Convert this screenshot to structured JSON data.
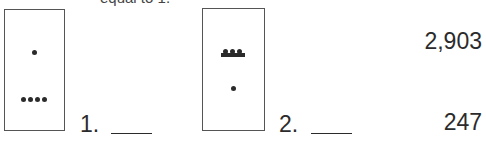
{
  "caption": "equal to 1.",
  "problems": [
    {
      "number": "1.",
      "glyph": {
        "top_level": {
          "dots": 1,
          "bars": 0
        },
        "bottom_level": {
          "dots": 4,
          "bars": 0
        }
      },
      "answer": ""
    },
    {
      "number": "2.",
      "glyph": {
        "top_level": {
          "dots": 3,
          "bars": 1
        },
        "bottom_level": {
          "dots": 1,
          "bars": 0
        }
      },
      "answer": ""
    }
  ],
  "answer_choices": [
    "2,903",
    "247"
  ]
}
